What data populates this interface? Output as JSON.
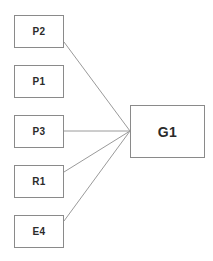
{
  "diagram": {
    "type": "path-diagram",
    "background_color": "#ffffff",
    "box_border_color": "#8a8a8a",
    "box_fill_color": "#ffffff",
    "edge_color": "#9a9a9a",
    "label_color": "#2b2b2b",
    "canvas": {
      "width": 213,
      "height": 261
    },
    "indicators": [
      {
        "id": "p2",
        "label": "P2",
        "x": 14,
        "y": 15,
        "width": 50,
        "height": 33
      },
      {
        "id": "p1",
        "label": "P1",
        "x": 14,
        "y": 65,
        "width": 50,
        "height": 33
      },
      {
        "id": "p3",
        "label": "P3",
        "x": 14,
        "y": 115,
        "width": 50,
        "height": 33
      },
      {
        "id": "r1",
        "label": "R1",
        "x": 14,
        "y": 165,
        "width": 50,
        "height": 33
      },
      {
        "id": "e4",
        "label": "E4",
        "x": 14,
        "y": 215,
        "width": 50,
        "height": 33
      }
    ],
    "constructs": [
      {
        "id": "g1",
        "label": "G1",
        "x": 130,
        "y": 105,
        "width": 75,
        "height": 53
      }
    ],
    "edges": [
      {
        "id": "p2-g1",
        "from": "P2",
        "to": "G1",
        "x1": 64,
        "y1": 42,
        "x2": 130,
        "y2": 131
      },
      {
        "id": "p3-g1",
        "from": "P3",
        "to": "G1",
        "x1": 64,
        "y1": 131,
        "x2": 130,
        "y2": 131
      },
      {
        "id": "r1-g1",
        "from": "R1",
        "to": "G1",
        "x1": 64,
        "y1": 172,
        "x2": 130,
        "y2": 131
      },
      {
        "id": "e4-g1",
        "from": "E4",
        "to": "G1",
        "x1": 64,
        "y1": 221,
        "x2": 130,
        "y2": 131
      }
    ]
  }
}
